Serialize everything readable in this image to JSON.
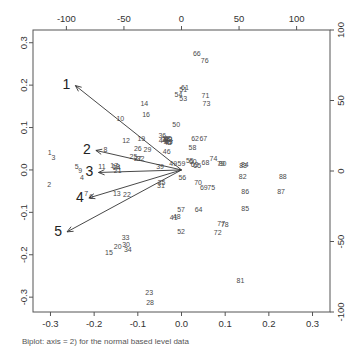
{
  "figure": {
    "caption": "Biplot: axis = 2) for the normal based level data",
    "frame_color": "#555555",
    "point_color": "#4a4a4a",
    "arrow_color": "#333333"
  },
  "chart_data": {
    "type": "scatter",
    "title": "",
    "xlabel": "",
    "ylabel": "",
    "grid": false,
    "legend": null,
    "xlim": [
      -0.34,
      0.34
    ],
    "ylim": [
      -0.335,
      0.33
    ],
    "axes": {
      "bottom": {
        "label": "",
        "ticks": [
          -0.3,
          -0.2,
          -0.1,
          0.0,
          0.1,
          0.2,
          0.3
        ],
        "tick_labels": [
          "-0.3",
          "-0.2",
          "-0.1",
          "0.0",
          "0.1",
          "0.2",
          "0.3"
        ]
      },
      "left": {
        "label": "",
        "ticks": [
          -0.3,
          -0.2,
          -0.1,
          0.0,
          0.1,
          0.2,
          0.3
        ],
        "tick_labels": [
          "-0.3",
          "-0.2",
          "-0.1",
          "0.0",
          "0.1",
          "0.2",
          "0.3"
        ]
      },
      "top": {
        "label": "",
        "ticks": [
          -100,
          -50,
          0,
          50,
          100
        ],
        "tick_labels": [
          "-100",
          "-50",
          "0",
          "50",
          "100"
        ],
        "range": [
          -129,
          129
        ]
      },
      "right": {
        "label": "",
        "ticks": [
          -100,
          -50,
          0,
          50,
          100
        ],
        "tick_labels": [
          "100",
          "50",
          "0",
          "-50",
          "-100"
        ],
        "range": [
          -127,
          126
        ]
      }
    },
    "points": [
      {
        "label": "1",
        "x": -0.302,
        "y": 0.039
      },
      {
        "label": "2",
        "x": -0.303,
        "y": -0.036
      },
      {
        "label": "3",
        "x": -0.293,
        "y": 0.028
      },
      {
        "label": "4",
        "x": -0.228,
        "y": -0.019
      },
      {
        "label": "5",
        "x": -0.24,
        "y": 0.006
      },
      {
        "label": "6",
        "x": -0.207,
        "y": -0.064
      },
      {
        "label": "7",
        "x": -0.218,
        "y": -0.057
      },
      {
        "label": "8",
        "x": -0.174,
        "y": 0.047
      },
      {
        "label": "9",
        "x": -0.232,
        "y": -0.002
      },
      {
        "label": "10",
        "x": -0.14,
        "y": 0.119
      },
      {
        "label": "11",
        "x": -0.182,
        "y": 0.007
      },
      {
        "label": "12",
        "x": -0.127,
        "y": 0.068
      },
      {
        "label": "13",
        "x": -0.148,
        "y": -0.056
      },
      {
        "label": "14",
        "x": -0.085,
        "y": 0.155
      },
      {
        "label": "15",
        "x": -0.166,
        "y": -0.196
      },
      {
        "label": "16",
        "x": -0.081,
        "y": 0.13
      },
      {
        "label": "17",
        "x": -0.154,
        "y": 0.008
      },
      {
        "label": "18",
        "x": -0.15,
        "y": 0.006
      },
      {
        "label": "19",
        "x": -0.092,
        "y": 0.072
      },
      {
        "label": "20",
        "x": -0.146,
        "y": -0.182
      },
      {
        "label": "21",
        "x": -0.146,
        "y": -0.003
      },
      {
        "label": "22",
        "x": -0.125,
        "y": -0.059
      },
      {
        "label": "23",
        "x": -0.074,
        "y": -0.291
      },
      {
        "label": "24",
        "x": -0.148,
        "y": 0.004
      },
      {
        "label": "25",
        "x": -0.11,
        "y": 0.031
      },
      {
        "label": "26",
        "x": -0.1,
        "y": 0.048
      },
      {
        "label": "27",
        "x": -0.1,
        "y": 0.026
      },
      {
        "label": "28",
        "x": -0.072,
        "y": -0.313
      },
      {
        "label": "29",
        "x": -0.078,
        "y": 0.047
      },
      {
        "label": "30",
        "x": -0.127,
        "y": -0.178
      },
      {
        "label": "31",
        "x": -0.047,
        "y": -0.039
      },
      {
        "label": "32",
        "x": -0.094,
        "y": 0.026
      },
      {
        "label": "33",
        "x": -0.128,
        "y": -0.162
      },
      {
        "label": "34",
        "x": -0.123,
        "y": -0.19
      },
      {
        "label": "35",
        "x": -0.046,
        "y": -0.031
      },
      {
        "label": "36",
        "x": -0.044,
        "y": 0.08
      },
      {
        "label": "37",
        "x": -0.037,
        "y": 0.07
      },
      {
        "label": "38",
        "x": -0.035,
        "y": 0.073
      },
      {
        "label": "39",
        "x": -0.049,
        "y": 0.006
      },
      {
        "label": "40",
        "x": -0.031,
        "y": 0.072
      },
      {
        "label": "41",
        "x": -0.018,
        "y": -0.114
      },
      {
        "label": "42",
        "x": -0.03,
        "y": 0.071
      },
      {
        "label": "43",
        "x": -0.029,
        "y": 0.066
      },
      {
        "label": "44",
        "x": -0.043,
        "y": 0.068
      },
      {
        "label": "45",
        "x": -0.032,
        "y": 0.063
      },
      {
        "label": "46",
        "x": -0.034,
        "y": 0.042
      },
      {
        "label": "47",
        "x": -0.028,
        "y": 0.064
      },
      {
        "label": "48",
        "x": -0.011,
        "y": -0.111
      },
      {
        "label": "49",
        "x": -0.019,
        "y": 0.014
      },
      {
        "label": "50",
        "x": -0.012,
        "y": 0.106
      },
      {
        "label": "51",
        "x": 0.004,
        "y": 0.187
      },
      {
        "label": "52",
        "x": -0.001,
        "y": -0.146
      },
      {
        "label": "53",
        "x": 0.004,
        "y": 0.166
      },
      {
        "label": "54",
        "x": -0.007,
        "y": 0.176
      },
      {
        "label": "55",
        "x": 0.019,
        "y": 0.02
      },
      {
        "label": "56",
        "x": 0.002,
        "y": -0.019
      },
      {
        "label": "57",
        "x": -0.001,
        "y": -0.094
      },
      {
        "label": "58",
        "x": 0.025,
        "y": 0.052
      },
      {
        "label": "59",
        "x": 0.0,
        "y": 0.014
      },
      {
        "label": "60",
        "x": 0.026,
        "y": 0.018
      },
      {
        "label": "61",
        "x": 0.008,
        "y": 0.192
      },
      {
        "label": "62",
        "x": 0.031,
        "y": 0.073
      },
      {
        "label": "63",
        "x": 0.03,
        "y": 0.012
      },
      {
        "label": "64",
        "x": 0.039,
        "y": -0.094
      },
      {
        "label": "65",
        "x": 0.036,
        "y": 0.008
      },
      {
        "label": "66",
        "x": 0.035,
        "y": 0.274
      },
      {
        "label": "67",
        "x": 0.05,
        "y": 0.073
      },
      {
        "label": "68",
        "x": 0.055,
        "y": 0.016
      },
      {
        "label": "69",
        "x": 0.051,
        "y": -0.043
      },
      {
        "label": "70",
        "x": 0.038,
        "y": -0.03
      },
      {
        "label": "71",
        "x": 0.055,
        "y": 0.175
      },
      {
        "label": "72",
        "x": 0.083,
        "y": -0.15
      },
      {
        "label": "73",
        "x": 0.057,
        "y": 0.156
      },
      {
        "label": "74",
        "x": 0.073,
        "y": 0.026
      },
      {
        "label": "75",
        "x": 0.068,
        "y": -0.043
      },
      {
        "label": "76",
        "x": 0.053,
        "y": 0.257
      },
      {
        "label": "77",
        "x": 0.091,
        "y": -0.127
      },
      {
        "label": "78",
        "x": 0.099,
        "y": -0.131
      },
      {
        "label": "79",
        "x": 0.09,
        "y": 0.013
      },
      {
        "label": "80",
        "x": 0.094,
        "y": 0.013
      },
      {
        "label": "81",
        "x": 0.135,
        "y": -0.263
      },
      {
        "label": "82",
        "x": 0.14,
        "y": -0.017
      },
      {
        "label": "83",
        "x": 0.141,
        "y": 0.01
      },
      {
        "label": "84",
        "x": 0.145,
        "y": 0.012
      },
      {
        "label": "85",
        "x": 0.146,
        "y": -0.092
      },
      {
        "label": "86",
        "x": 0.146,
        "y": -0.052
      },
      {
        "label": "87",
        "x": 0.228,
        "y": -0.053
      },
      {
        "label": "88",
        "x": 0.232,
        "y": -0.018
      }
    ],
    "arrows": [
      {
        "label": "1",
        "x0": 0.0,
        "y0": 0.0,
        "x": -0.243,
        "y": 0.199
      },
      {
        "label": "2",
        "x0": 0.0,
        "y0": 0.0,
        "x": -0.196,
        "y": 0.046
      },
      {
        "label": "3",
        "x0": 0.0,
        "y0": 0.0,
        "x": -0.19,
        "y": -0.006
      },
      {
        "label": "4",
        "x0": 0.0,
        "y0": 0.0,
        "x": -0.212,
        "y": -0.066
      },
      {
        "label": "5",
        "x0": 0.0,
        "y0": 0.0,
        "x": -0.262,
        "y": -0.146
      }
    ]
  }
}
